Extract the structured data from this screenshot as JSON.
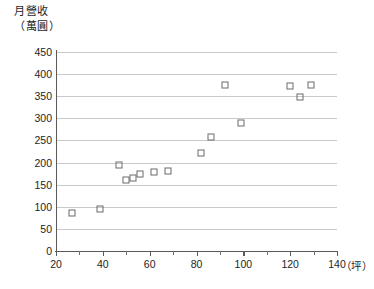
{
  "chart_data": {
    "type": "scatter",
    "title": "",
    "ylabel": "月營收\n（萬圓）",
    "ylabel_line1": "月營收",
    "ylabel_line2": "（萬圓）",
    "xlabel": "（坪）",
    "xlim": [
      20,
      140
    ],
    "ylim": [
      0,
      450
    ],
    "xticks": [
      20,
      40,
      60,
      80,
      100,
      120,
      140
    ],
    "xticks_minor": [
      30,
      50,
      70,
      90,
      110,
      130
    ],
    "yticks": [
      0,
      50,
      100,
      150,
      200,
      250,
      300,
      350,
      400,
      450
    ],
    "grid": "horizontal",
    "legend": "none",
    "marker": "open-square",
    "points": [
      {
        "x": 27,
        "y": 85
      },
      {
        "x": 39,
        "y": 96
      },
      {
        "x": 47,
        "y": 195
      },
      {
        "x": 50,
        "y": 160
      },
      {
        "x": 53,
        "y": 165
      },
      {
        "x": 56,
        "y": 175
      },
      {
        "x": 62,
        "y": 178
      },
      {
        "x": 68,
        "y": 182
      },
      {
        "x": 82,
        "y": 222
      },
      {
        "x": 86,
        "y": 258
      },
      {
        "x": 92,
        "y": 375
      },
      {
        "x": 99,
        "y": 290
      },
      {
        "x": 120,
        "y": 372
      },
      {
        "x": 124,
        "y": 348
      },
      {
        "x": 129,
        "y": 375
      }
    ]
  },
  "axis": {
    "x_unit_label": "（坪）"
  }
}
